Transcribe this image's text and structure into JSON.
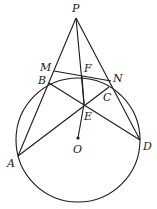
{
  "diagram": {
    "type": "geometry",
    "circle": {
      "center": "O",
      "cx": 78,
      "cy": 140,
      "r": 62
    },
    "points": [
      {
        "name": "P",
        "x": 76,
        "y": 18,
        "lx": 72,
        "ly": 12
      },
      {
        "name": "M",
        "x": 54,
        "y": 71,
        "lx": 40,
        "ly": 71
      },
      {
        "name": "B",
        "x": 49,
        "y": 83,
        "lx": 38,
        "ly": 84
      },
      {
        "name": "F",
        "x": 82,
        "y": 76,
        "lx": 84,
        "ly": 72
      },
      {
        "name": "N",
        "x": 111,
        "y": 81,
        "lx": 113,
        "ly": 82
      },
      {
        "name": "C",
        "x": 109,
        "y": 87,
        "lx": 103,
        "ly": 101
      },
      {
        "name": "E",
        "x": 84,
        "y": 104,
        "lx": 84,
        "ly": 120
      },
      {
        "name": "O",
        "x": 78,
        "y": 138,
        "lx": 73,
        "ly": 153
      },
      {
        "name": "A",
        "x": 18,
        "y": 156,
        "lx": 7,
        "ly": 167
      },
      {
        "name": "D",
        "x": 140,
        "y": 140,
        "lx": 143,
        "ly": 150
      }
    ],
    "segments": [
      [
        "P",
        "A"
      ],
      [
        "P",
        "D"
      ],
      [
        "P",
        "E"
      ],
      [
        "M",
        "N"
      ],
      [
        "B",
        "D"
      ],
      [
        "A",
        "C"
      ],
      [
        "F",
        "E"
      ],
      [
        "E",
        "O"
      ]
    ]
  }
}
